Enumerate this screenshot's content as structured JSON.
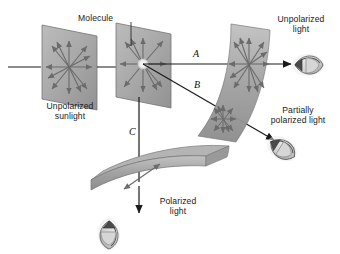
{
  "figure": {
    "background": "#ffffff",
    "plane_fill": "#a8a8a8",
    "plane_stroke": "#6e6e6e",
    "arrow_color": "#6b6b6b",
    "ray_color": "#1a1a1a",
    "text_color": "#1a1a1a"
  },
  "labels": {
    "unpolarized_sunlight_line1": "Unpolarized",
    "unpolarized_sunlight_line2": "sunlight",
    "molecule": "Molecule",
    "unpolarized_light_line1": "Unpolarized",
    "unpolarized_light_line2": "light",
    "partially_polarized_line1": "Partially",
    "partially_polarized_line2": "polarized light",
    "polarized_light_line1": "Polarized",
    "polarized_light_line2": "light",
    "ray_a": "A",
    "ray_b": "B",
    "ray_c": "C"
  },
  "elements": {
    "incident_plane": "unpolarized-sunlight-plane",
    "molecule_plane": "molecule-scattering-plane",
    "plane_a": "unpolarized-light-plane",
    "surface_b": "partially-polarized-surface",
    "surface_c": "polarized-light-surface",
    "eye_a": "eye-unpolarized",
    "eye_b": "eye-partially-polarized",
    "eye_c": "eye-polarized"
  }
}
